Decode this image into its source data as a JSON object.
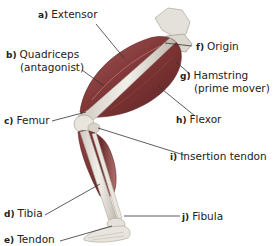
{
  "diagram": {
    "colors": {
      "muscle": "#7a2f2f",
      "muscle_highlight": "#b56a6a",
      "bone": "#e6e2dc",
      "bone_shadow": "#b9b3aa",
      "leader_line": "#333333",
      "text": "#222222"
    },
    "labels": [
      {
        "key": "a)",
        "text": "Extensor",
        "sub": ""
      },
      {
        "key": "b)",
        "text": "Quadriceps",
        "sub": "(antagonist)"
      },
      {
        "key": "c)",
        "text": "Femur",
        "sub": ""
      },
      {
        "key": "d)",
        "text": "Tibia",
        "sub": ""
      },
      {
        "key": "e)",
        "text": "Tendon",
        "sub": ""
      },
      {
        "key": "f)",
        "text": "Origin",
        "sub": ""
      },
      {
        "key": "g)",
        "text": "Hamstring",
        "sub": "(prime mover)"
      },
      {
        "key": "h)",
        "text": "Flexor",
        "sub": ""
      },
      {
        "key": "i)",
        "text": "Insertion tendon",
        "sub": ""
      },
      {
        "key": "j)",
        "text": "Fibula",
        "sub": ""
      }
    ]
  }
}
